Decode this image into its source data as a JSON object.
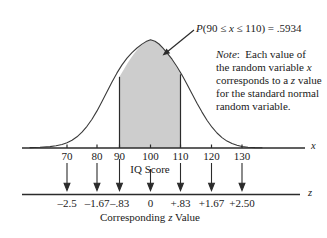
{
  "figure": {
    "probability_annotation": {
      "prefix": "P",
      "expression": "(90 ≤ x ≤ 110)",
      "equals": " = .5934",
      "full": "P(90 ≤ x ≤ 110) = .5934"
    },
    "note": {
      "label": "Note",
      "colon": ":",
      "lines": [
        "Each value of",
        "the random variable x",
        "corresponds to a z value",
        "for the standard normal",
        "random variable."
      ],
      "full": "Note: Each value of the random variable x corresponds to a z value for the standard normal random variable."
    },
    "x_axis": {
      "variable_label": "x",
      "caption": "IQ Score",
      "tick_labels": [
        "70",
        "80",
        "90",
        "100",
        "110",
        "120",
        "130"
      ]
    },
    "z_axis": {
      "variable_label": "z",
      "caption_parts": [
        "Corresponding ",
        "z",
        " Value"
      ],
      "caption": "Corresponding z Value",
      "tick_labels": [
        "–2.5",
        "–1.67",
        "–.83",
        "0",
        "+.83",
        "+1.67",
        "+2.50"
      ]
    },
    "colors": {
      "shaded_region": "#cdcdcd",
      "curve_stroke": "#3a3a3a",
      "axis_stroke": "#2b2b2b",
      "background": "#ffffff",
      "text": "#1a1a1a"
    }
  },
  "chart_data": {
    "type": "line",
    "title": "",
    "subtitle": "",
    "distribution": "normal",
    "mean": 100,
    "std_dev": 12,
    "xlabel": "IQ Score",
    "ylabel": "",
    "xlim": [
      58,
      142
    ],
    "shaded_interval": [
      90,
      110
    ],
    "shaded_probability": 0.5934,
    "probability_statement": "P(90 ≤ x ≤ 110) = .5934",
    "grid": false,
    "legend": false,
    "x_ticks": [
      70,
      80,
      90,
      100,
      110,
      120,
      130
    ],
    "x_tick_labels": [
      "70",
      "80",
      "90",
      "100",
      "110",
      "120",
      "130"
    ],
    "z_ticks": [
      -2.5,
      -1.67,
      -0.83,
      0,
      0.83,
      1.67,
      2.5
    ],
    "z_tick_labels": [
      "–2.5",
      "–1.67",
      "–.83",
      "0",
      "+.83",
      "+1.67",
      "+2.50"
    ],
    "secondary_axis_label": "Corresponding z Value",
    "annotations": [
      "P(90 ≤ x ≤ 110) = .5934",
      "Note: Each value of the random variable x corresponds to a z value for the standard normal random variable."
    ]
  }
}
